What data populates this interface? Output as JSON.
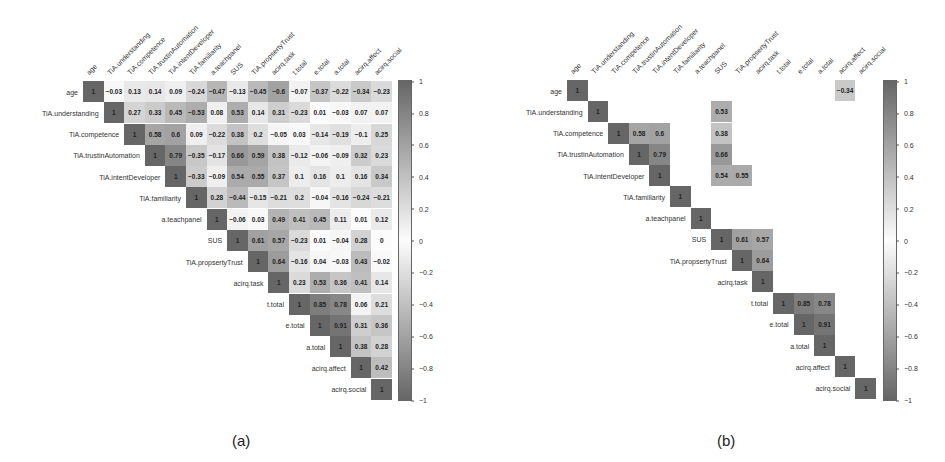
{
  "chart_data": [
    {
      "type": "heatmap",
      "title": "(a)",
      "subtype": "correlation matrix (upper triangle, all coefficients)",
      "variables": [
        "age",
        "TiA.understanding",
        "TiA.competence",
        "TiA.trustinAutomation",
        "TiA.intentDeveloper",
        "TiA.familiarity",
        "a.teachpanel",
        "SUS",
        "TiA.propsertyTrust",
        "acirq.task",
        "t.total",
        "e.total",
        "a.total",
        "acirq.affect",
        "acirq.social"
      ],
      "matrix": [
        [
          1,
          -0.03,
          0.13,
          0.14,
          0.09,
          -0.24,
          -0.47,
          -0.13,
          -0.45,
          -0.6,
          -0.07,
          -0.37,
          -0.22,
          -0.34,
          -0.23
        ],
        [
          null,
          1,
          0.27,
          0.33,
          0.45,
          -0.53,
          0.08,
          0.53,
          0.14,
          0.31,
          -0.23,
          0.01,
          -0.03,
          0.07,
          0.07
        ],
        [
          null,
          null,
          1,
          0.58,
          0.6,
          0.09,
          -0.22,
          0.38,
          0.2,
          -0.05,
          0.03,
          -0.14,
          -0.19,
          -0.1,
          0.25
        ],
        [
          null,
          null,
          null,
          1,
          0.79,
          -0.35,
          -0.17,
          0.66,
          0.59,
          0.38,
          -0.12,
          -0.06,
          -0.09,
          0.32,
          0.23
        ],
        [
          null,
          null,
          null,
          null,
          1,
          -0.33,
          -0.09,
          0.54,
          0.55,
          0.37,
          0.1,
          0.16,
          0.1,
          0.16,
          0.34
        ],
        [
          null,
          null,
          null,
          null,
          null,
          1,
          0.28,
          -0.44,
          -0.15,
          -0.21,
          0.2,
          -0.04,
          -0.16,
          -0.24,
          -0.21
        ],
        [
          null,
          null,
          null,
          null,
          null,
          null,
          1,
          -0.06,
          0.03,
          0.49,
          0.41,
          0.45,
          0.11,
          0.01,
          0.12
        ],
        [
          null,
          null,
          null,
          null,
          null,
          null,
          null,
          1,
          0.61,
          0.57,
          -0.23,
          0.01,
          -0.04,
          0.28,
          0
        ],
        [
          null,
          null,
          null,
          null,
          null,
          null,
          null,
          null,
          1,
          0.64,
          -0.16,
          0.04,
          -0.03,
          0.43,
          -0.02
        ],
        [
          null,
          null,
          null,
          null,
          null,
          null,
          null,
          null,
          null,
          1,
          0.23,
          0.53,
          0.36,
          0.41,
          0.14
        ],
        [
          null,
          null,
          null,
          null,
          null,
          null,
          null,
          null,
          null,
          null,
          1,
          0.85,
          0.78,
          0.06,
          0.21
        ],
        [
          null,
          null,
          null,
          null,
          null,
          null,
          null,
          null,
          null,
          null,
          null,
          1,
          0.91,
          0.31,
          0.36
        ],
        [
          null,
          null,
          null,
          null,
          null,
          null,
          null,
          null,
          null,
          null,
          null,
          null,
          1,
          0.38,
          0.28
        ],
        [
          null,
          null,
          null,
          null,
          null,
          null,
          null,
          null,
          null,
          null,
          null,
          null,
          null,
          1,
          0.42
        ],
        [
          null,
          null,
          null,
          null,
          null,
          null,
          null,
          null,
          null,
          null,
          null,
          null,
          null,
          null,
          1
        ]
      ],
      "colorbar": {
        "min": -1,
        "max": 1,
        "ticks": [
          1,
          0.8,
          0.6,
          0.4,
          0.2,
          0,
          -0.2,
          -0.4,
          -0.6,
          -0.8,
          -1
        ]
      },
      "grid": false,
      "legend_position": "right"
    },
    {
      "type": "heatmap",
      "title": "(b)",
      "subtype": "correlation matrix (upper triangle, significant coefficients only)",
      "variables": [
        "age",
        "TiA.understanding",
        "TiA.competence",
        "TiA.trustinAutomation",
        "TiA.intentDeveloper",
        "TiA.familiarity",
        "a.teachpanel",
        "SUS",
        "TiA.propsertyTrust",
        "acirq.task",
        "t.total",
        "e.total",
        "a.total",
        "acirq.affect",
        "acirq.social"
      ],
      "matrix": [
        [
          1,
          null,
          null,
          null,
          null,
          null,
          null,
          null,
          null,
          null,
          null,
          null,
          null,
          -0.34,
          null
        ],
        [
          null,
          1,
          null,
          null,
          null,
          null,
          null,
          0.53,
          null,
          null,
          null,
          null,
          null,
          null,
          null
        ],
        [
          null,
          null,
          1,
          0.58,
          0.6,
          null,
          null,
          0.38,
          null,
          null,
          null,
          null,
          null,
          null,
          null
        ],
        [
          null,
          null,
          null,
          1,
          0.79,
          null,
          null,
          0.66,
          null,
          null,
          null,
          null,
          null,
          null,
          null
        ],
        [
          null,
          null,
          null,
          null,
          1,
          null,
          null,
          0.54,
          0.55,
          null,
          null,
          null,
          null,
          null,
          null
        ],
        [
          null,
          null,
          null,
          null,
          null,
          1,
          null,
          null,
          null,
          null,
          null,
          null,
          null,
          null,
          null
        ],
        [
          null,
          null,
          null,
          null,
          null,
          null,
          1,
          null,
          null,
          null,
          null,
          null,
          null,
          null,
          null
        ],
        [
          null,
          null,
          null,
          null,
          null,
          null,
          null,
          1,
          0.61,
          0.57,
          null,
          null,
          null,
          null,
          null
        ],
        [
          null,
          null,
          null,
          null,
          null,
          null,
          null,
          null,
          1,
          0.64,
          null,
          null,
          null,
          null,
          null
        ],
        [
          null,
          null,
          null,
          null,
          null,
          null,
          null,
          null,
          null,
          1,
          null,
          null,
          null,
          null,
          null
        ],
        [
          null,
          null,
          null,
          null,
          null,
          null,
          null,
          null,
          null,
          null,
          1,
          0.85,
          0.78,
          null,
          null
        ],
        [
          null,
          null,
          null,
          null,
          null,
          null,
          null,
          null,
          null,
          null,
          null,
          1,
          0.91,
          null,
          null
        ],
        [
          null,
          null,
          null,
          null,
          null,
          null,
          null,
          null,
          null,
          null,
          null,
          null,
          1,
          null,
          null
        ],
        [
          null,
          null,
          null,
          null,
          null,
          null,
          null,
          null,
          null,
          null,
          null,
          null,
          null,
          1,
          null
        ],
        [
          null,
          null,
          null,
          null,
          null,
          null,
          null,
          null,
          null,
          null,
          null,
          null,
          null,
          null,
          1
        ]
      ],
      "colorbar": {
        "min": -1,
        "max": 1,
        "ticks": [
          1,
          0.8,
          0.6,
          0.4,
          0.2,
          0,
          -0.2,
          -0.4,
          -0.6,
          -0.8,
          -1
        ]
      },
      "grid": false,
      "legend_position": "right"
    }
  ],
  "captions": {
    "a": "(a)",
    "b": "(b)"
  }
}
